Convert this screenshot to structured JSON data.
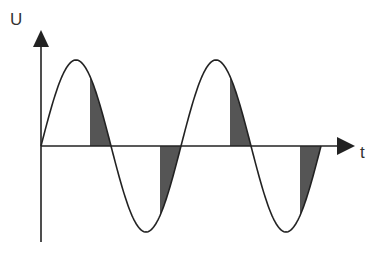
{
  "diagram": {
    "title": "",
    "y_axis_label": "U",
    "x_axis_label": "t",
    "waveform": "sine",
    "periods_shown": 2,
    "shaded_segments": [
      {
        "half_cycle": "positive",
        "period": 1,
        "description": "trailing portion of positive half-wave"
      },
      {
        "half_cycle": "negative",
        "period": 1,
        "description": "trailing portion of negative half-wave"
      },
      {
        "half_cycle": "positive",
        "period": 2,
        "description": "trailing portion of positive half-wave"
      },
      {
        "half_cycle": "negative",
        "period": 2,
        "description": "trailing portion of negative half-wave"
      }
    ],
    "shade_start_phase_fraction": 0.7,
    "colors": {
      "line": "#222222",
      "shade": "#555555",
      "background": "#ffffff"
    }
  }
}
